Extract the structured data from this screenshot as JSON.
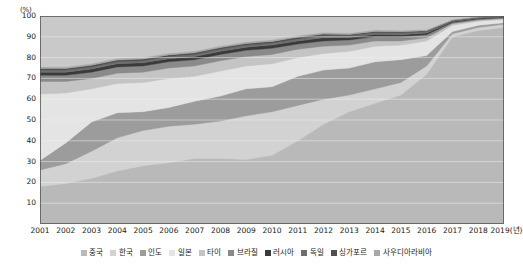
{
  "chart_data": {
    "type": "area",
    "title": "",
    "subtitle": "",
    "xlabel": "2019(년)",
    "ylabel": "(%)",
    "y_unit": "(%)",
    "x_axis_unit_suffix": "(년)",
    "grid": true,
    "legend_position": "bottom",
    "stacked": true,
    "ylim": [
      0,
      100
    ],
    "yticks": [
      100,
      90,
      80,
      70,
      60,
      50,
      40,
      30,
      20,
      10
    ],
    "ytick_labels": [
      "100",
      "90",
      "80",
      "70",
      "60",
      "50",
      "40",
      "30",
      "20",
      "10"
    ],
    "categories": [
      "2001",
      "2002",
      "2003",
      "2004",
      "2005",
      "2006",
      "2007",
      "2008",
      "2009",
      "2010",
      "2011",
      "2012",
      "2013",
      "2014",
      "2015",
      "2016",
      "2017",
      "2018",
      "2019"
    ],
    "xtick_labels": [
      "2001",
      "2002",
      "2003",
      "2004",
      "2005",
      "2006",
      "2007",
      "2008",
      "2009",
      "2010",
      "2011",
      "2012",
      "2013",
      "2014",
      "2015",
      "2016",
      "2017",
      "2018",
      "2019(년)"
    ],
    "series": [
      {
        "name": "중국",
        "color": "#b9b9b9",
        "values": [
          18.0,
          19.5,
          22.0,
          25.5,
          28.0,
          29.5,
          31.5,
          31.5,
          31.0,
          33.0,
          40.0,
          48.0,
          54.0,
          58.0,
          62.0,
          72.0,
          90.0,
          93.0,
          94.5
        ]
      },
      {
        "name": "한국",
        "color": "#d2d2d2",
        "values": [
          8.0,
          9.5,
          13.0,
          16.0,
          17.0,
          17.5,
          16.5,
          18.0,
          21.0,
          21.0,
          17.0,
          12.0,
          8.0,
          7.0,
          6.0,
          4.0,
          1.5,
          1.5,
          1.5
        ]
      },
      {
        "name": "인도",
        "color": "#9c9c9c",
        "values": [
          4.5,
          10.0,
          14.0,
          12.0,
          9.0,
          9.0,
          11.0,
          12.0,
          13.0,
          12.0,
          14.0,
          14.0,
          13.0,
          13.0,
          11.0,
          5.0,
          1.0,
          1.0,
          0.8
        ]
      },
      {
        "name": "일본",
        "color": "#e4e4e4",
        "values": [
          32.0,
          24.0,
          16.0,
          14.0,
          14.0,
          14.0,
          12.0,
          12.0,
          11.0,
          11.0,
          9.0,
          8.0,
          8.0,
          7.5,
          7.0,
          7.0,
          3.0,
          2.0,
          1.5
        ]
      },
      {
        "name": "타이",
        "color": "#c4c4c4",
        "values": [
          6.0,
          5.5,
          5.0,
          5.0,
          5.0,
          5.0,
          5.0,
          5.0,
          4.5,
          4.5,
          4.0,
          3.5,
          3.0,
          2.5,
          2.0,
          1.5,
          0.8,
          0.5,
          0.5
        ]
      },
      {
        "name": "브라질",
        "color": "#8a8a8a",
        "values": [
          3.0,
          3.0,
          3.0,
          3.0,
          3.0,
          3.0,
          3.0,
          3.0,
          3.0,
          3.0,
          2.5,
          2.5,
          2.5,
          2.0,
          2.0,
          1.5,
          0.6,
          0.5,
          0.4
        ]
      },
      {
        "name": "러시아",
        "color": "#3a3a3a",
        "values": [
          1.5,
          1.5,
          1.5,
          1.5,
          1.5,
          1.5,
          1.5,
          1.5,
          1.5,
          1.5,
          1.5,
          1.5,
          1.2,
          1.2,
          1.0,
          0.8,
          0.4,
          0.4,
          0.3
        ]
      },
      {
        "name": "독일",
        "color": "#6e6e6e",
        "values": [
          1.0,
          1.0,
          1.0,
          1.0,
          1.0,
          1.0,
          1.0,
          1.0,
          1.0,
          1.0,
          1.0,
          1.0,
          0.8,
          0.8,
          0.8,
          0.6,
          0.3,
          0.3,
          0.2
        ]
      },
      {
        "name": "싱가포르",
        "color": "#4f4f4f",
        "values": [
          0.8,
          0.8,
          0.8,
          0.8,
          0.8,
          0.8,
          0.8,
          0.8,
          0.8,
          0.8,
          0.8,
          0.8,
          0.6,
          0.6,
          0.6,
          0.5,
          0.3,
          0.2,
          0.2
        ]
      },
      {
        "name": "사우디아라비아",
        "color": "#a8a8a8",
        "values": [
          0.6,
          0.6,
          0.6,
          0.6,
          0.6,
          0.6,
          0.6,
          0.6,
          0.6,
          0.6,
          0.6,
          0.6,
          0.5,
          0.5,
          0.5,
          0.4,
          0.2,
          0.2,
          0.2
        ]
      }
    ]
  },
  "plot": {
    "background_color": "#c9c9c9",
    "border_color": "#555555",
    "gridline_color": "#efefef"
  },
  "legend": {
    "items": [
      {
        "label": "중국",
        "color": "#b9b9b9"
      },
      {
        "label": "한국",
        "color": "#d2d2d2"
      },
      {
        "label": "인도",
        "color": "#9c9c9c"
      },
      {
        "label": "일본",
        "color": "#e4e4e4"
      },
      {
        "label": "타이",
        "color": "#c4c4c4"
      },
      {
        "label": "브라질",
        "color": "#8a8a8a"
      },
      {
        "label": "러시아",
        "color": "#3a3a3a"
      },
      {
        "label": "독일",
        "color": "#6e6e6e"
      },
      {
        "label": "싱가포르",
        "color": "#4f4f4f"
      },
      {
        "label": "사우디아라비아",
        "color": "#a8a8a8"
      }
    ]
  }
}
